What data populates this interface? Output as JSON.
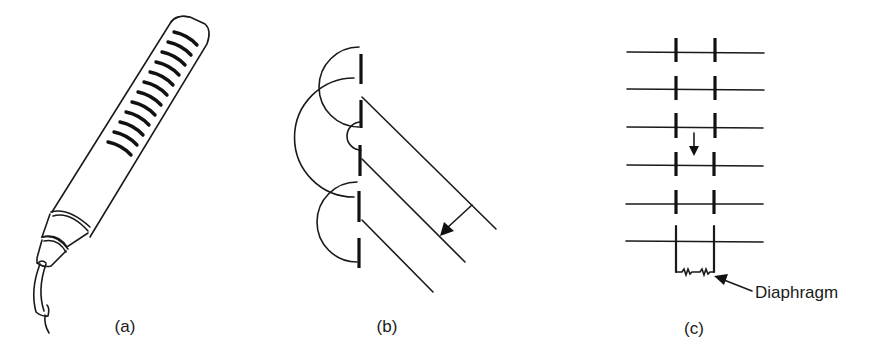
{
  "figure": {
    "panels": [
      {
        "id": "a",
        "label": "(a)",
        "description": "Ribbon microphone with slotted tubular body and cable"
      },
      {
        "id": "b",
        "label": "(b)",
        "description": "Plane wave incident on slotted aperture producing diffracted semicircular wavelets"
      },
      {
        "id": "c",
        "label": "(c)",
        "description": "Slotted tube acting as acoustic line terminated by a diaphragm"
      }
    ],
    "annotations": {
      "diaphragm": "Diaphragm"
    },
    "colors": {
      "ink": "#1a1a1a",
      "background": "#ffffff"
    }
  }
}
